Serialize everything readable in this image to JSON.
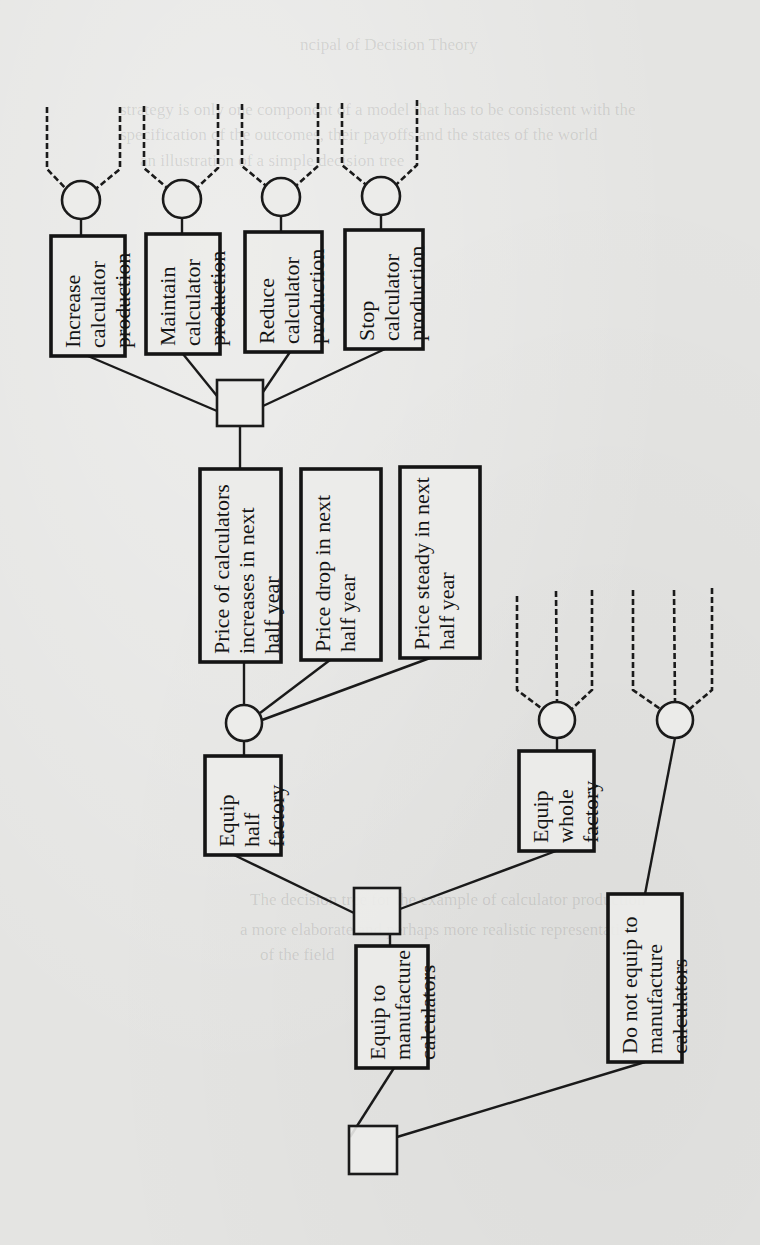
{
  "diagram": {
    "type": "decision-tree",
    "orientation": "rotated-90-ccw",
    "colors": {
      "ink": "#141414",
      "paper": "#e4e4e2"
    },
    "decision_nodes": [
      {
        "id": "d1",
        "x": 373,
        "y": 1150,
        "size": 48
      },
      {
        "id": "d2",
        "x": 377,
        "y": 911,
        "size": 46
      },
      {
        "id": "d3",
        "x": 240,
        "y": 403,
        "size": 46
      }
    ],
    "chance_nodes": [
      {
        "id": "c1",
        "x": 244,
        "y": 723,
        "r": 18
      },
      {
        "id": "c2",
        "x": 557,
        "y": 720,
        "r": 18
      },
      {
        "id": "c3",
        "x": 675,
        "y": 720,
        "r": 18
      },
      {
        "id": "c4",
        "x": 81,
        "y": 200,
        "r": 19
      },
      {
        "id": "c5",
        "x": 182,
        "y": 199,
        "r": 19
      },
      {
        "id": "c6",
        "x": 281,
        "y": 197,
        "r": 19
      },
      {
        "id": "c7",
        "x": 381,
        "y": 196,
        "r": 19
      }
    ],
    "boxes": [
      {
        "id": "b_equip",
        "x": 356,
        "y": 946,
        "w": 72,
        "h": 122,
        "lines": [
          "Equip to",
          "manufacture",
          "calculators"
        ]
      },
      {
        "id": "b_noequip",
        "x": 608,
        "y": 894,
        "w": 74,
        "h": 168,
        "lines": [
          "Do not equip to",
          "manufacture",
          "calculators"
        ]
      },
      {
        "id": "b_half",
        "x": 205,
        "y": 756,
        "w": 76,
        "h": 99,
        "lines": [
          "Equip",
          "half",
          "factory"
        ]
      },
      {
        "id": "b_whole",
        "x": 519,
        "y": 751,
        "w": 75,
        "h": 100,
        "lines": [
          "Equip",
          "whole",
          "factory"
        ]
      },
      {
        "id": "b_increase",
        "x": 200,
        "y": 469,
        "w": 81,
        "h": 193,
        "lines": [
          "Price of calculators",
          "increases in next",
          "half year"
        ]
      },
      {
        "id": "b_drop",
        "x": 301,
        "y": 469,
        "w": 80,
        "h": 191,
        "lines": [
          "Price drop in next",
          "half year"
        ]
      },
      {
        "id": "b_steady",
        "x": 400,
        "y": 467,
        "w": 80,
        "h": 191,
        "lines": [
          "Price steady in next",
          "half year"
        ]
      },
      {
        "id": "b_inc_prod",
        "x": 51,
        "y": 236,
        "w": 74,
        "h": 120,
        "lines": [
          "Increase",
          "calculator",
          "production"
        ]
      },
      {
        "id": "b_main_prod",
        "x": 146,
        "y": 234,
        "w": 74,
        "h": 120,
        "lines": [
          "Maintain",
          "calculator",
          "production"
        ]
      },
      {
        "id": "b_red_prod",
        "x": 245,
        "y": 232,
        "w": 77,
        "h": 120,
        "lines": [
          "Reduce",
          "calculator",
          "production"
        ]
      },
      {
        "id": "b_stop_prod",
        "x": 345,
        "y": 230,
        "w": 78,
        "h": 119,
        "lines": [
          "Stop",
          "calculator",
          "production"
        ]
      }
    ],
    "edges": [
      {
        "x1": 350,
        "y1": 1137,
        "x2": 394,
        "y2": 1068
      },
      {
        "x1": 397,
        "y1": 1137,
        "x2": 645,
        "y2": 1062
      },
      {
        "x1": 645,
        "y1": 894,
        "x2": 675,
        "y2": 738
      },
      {
        "x1": 390,
        "y1": 946,
        "x2": 390,
        "y2": 934
      },
      {
        "x1": 354,
        "y1": 913,
        "x2": 234,
        "y2": 855
      },
      {
        "x1": 400,
        "y1": 909,
        "x2": 556,
        "y2": 851
      },
      {
        "x1": 244,
        "y1": 756,
        "x2": 244,
        "y2": 741
      },
      {
        "x1": 557,
        "y1": 751,
        "x2": 557,
        "y2": 738
      },
      {
        "x1": 244,
        "y1": 705,
        "x2": 244,
        "y2": 662
      },
      {
        "x1": 260,
        "y1": 713,
        "x2": 330,
        "y2": 660
      },
      {
        "x1": 262,
        "y1": 720,
        "x2": 430,
        "y2": 658
      },
      {
        "x1": 240,
        "y1": 469,
        "x2": 240,
        "y2": 426
      },
      {
        "x1": 217,
        "y1": 411,
        "x2": 88,
        "y2": 356
      },
      {
        "x1": 217,
        "y1": 396,
        "x2": 183,
        "y2": 354
      },
      {
        "x1": 263,
        "y1": 392,
        "x2": 290,
        "y2": 352
      },
      {
        "x1": 263,
        "y1": 406,
        "x2": 385,
        "y2": 349
      },
      {
        "x1": 81,
        "y1": 236,
        "x2": 81,
        "y2": 219
      },
      {
        "x1": 182,
        "y1": 234,
        "x2": 182,
        "y2": 218
      },
      {
        "x1": 281,
        "y1": 232,
        "x2": 281,
        "y2": 216
      },
      {
        "x1": 381,
        "y1": 230,
        "x2": 381,
        "y2": 215
      }
    ],
    "dashed_branches": [
      {
        "node": "c2",
        "tops": [
          [
            517,
            596
          ],
          [
            556,
            591
          ],
          [
            592,
            590
          ]
        ]
      },
      {
        "node": "c3",
        "tops": [
          [
            633,
            590
          ],
          [
            674,
            590
          ],
          [
            712,
            588
          ]
        ]
      },
      {
        "node": "c4",
        "tops": [
          [
            47,
            107
          ],
          [
            120,
            107
          ]
        ]
      },
      {
        "node": "c5",
        "tops": [
          [
            144,
            106
          ],
          [
            218,
            104
          ]
        ]
      },
      {
        "node": "c6",
        "tops": [
          [
            242,
            104
          ],
          [
            318,
            103
          ]
        ]
      },
      {
        "node": "c7",
        "tops": [
          [
            342,
            103
          ],
          [
            417,
            100
          ]
        ]
      }
    ]
  },
  "background_bleed_text": [
    "ncipal of Decision Theory",
    "strategy is only one component of a model that has to be consistent with the",
    "specification of the outcomes, their payoffs and the states of the world",
    "an illustration of a simple decision tree",
    "The decision tree for the example of calculator production",
    "a more elaborate and perhaps more realistic representation",
    "of the field"
  ]
}
